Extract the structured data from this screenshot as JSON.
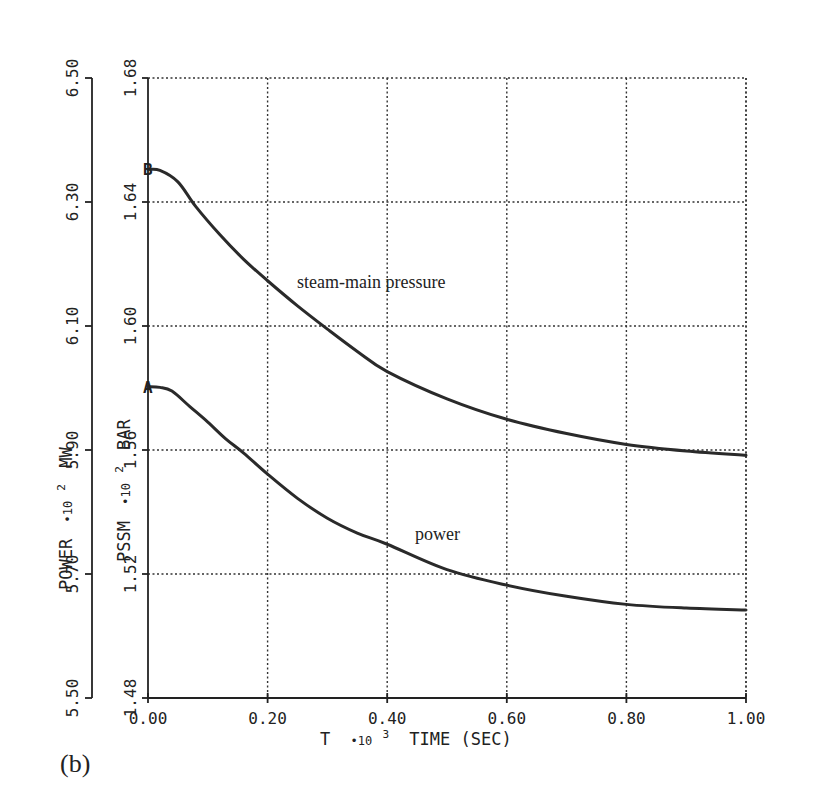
{
  "chart_data": {
    "type": "line",
    "panel_label": "(b)",
    "title": "",
    "xlabel": "T *10³ TIME (SEC)",
    "xlabel_parts": {
      "var": "T",
      "mult": "•10",
      "exp": "3",
      "rest": "TIME (SEC)"
    },
    "xlim": [
      0.0,
      1.0
    ],
    "xticks": [
      0.0,
      0.2,
      0.4,
      0.6,
      0.8,
      1.0
    ],
    "xtick_labels": [
      "0.00",
      "0.20",
      "0.40",
      "0.60",
      "0.80",
      "1.00"
    ],
    "grid": true,
    "y_axes": [
      {
        "id": "power",
        "label": "POWER *10² MW",
        "label_parts": {
          "var": "POWER",
          "mult": "•10",
          "exp": "2",
          "unit": "MW"
        },
        "ylim": [
          5.5,
          6.5
        ],
        "yticks": [
          5.5,
          5.7,
          5.9,
          6.1,
          6.3,
          6.5
        ],
        "ytick_labels": [
          "5.50",
          "5.70",
          "5.90",
          "6.10",
          "6.30",
          "6.50"
        ],
        "position": "outer-left"
      },
      {
        "id": "pssm",
        "label": "PSSM *10² BAR",
        "label_parts": {
          "var": "PSSM",
          "mult": "•10",
          "exp": "2",
          "unit": "BAR"
        },
        "ylim": [
          1.48,
          1.68
        ],
        "yticks": [
          1.48,
          1.52,
          1.56,
          1.6,
          1.64,
          1.68
        ],
        "ytick_labels": [
          "1.48",
          "1.52",
          "1.56",
          "1.60",
          "1.64",
          "1.68"
        ],
        "position": "inner-left"
      }
    ],
    "series": [
      {
        "name": "steam-main pressure",
        "marker": "B",
        "axis": "pssm",
        "annotation": "steam-main pressure",
        "x": [
          0.0,
          0.02,
          0.05,
          0.08,
          0.12,
          0.16,
          0.2,
          0.25,
          0.3,
          0.35,
          0.4,
          0.5,
          0.6,
          0.7,
          0.8,
          0.9,
          1.0
        ],
        "values": [
          1.6505,
          1.6502,
          1.6465,
          1.6385,
          1.6295,
          1.6215,
          1.6146,
          1.6065,
          1.599,
          1.5918,
          1.5853,
          1.5765,
          1.5699,
          1.5653,
          1.5618,
          1.5597,
          1.5583
        ]
      },
      {
        "name": "power",
        "marker": "A",
        "axis": "power",
        "annotation": "power",
        "x": [
          0.0,
          0.02,
          0.04,
          0.07,
          0.1,
          0.13,
          0.16,
          0.2,
          0.25,
          0.3,
          0.35,
          0.4,
          0.5,
          0.6,
          0.7,
          0.8,
          0.9,
          1.0
        ],
        "values": [
          6.002,
          6.001,
          5.995,
          5.97,
          5.945,
          5.918,
          5.895,
          5.861,
          5.822,
          5.79,
          5.766,
          5.748,
          5.707,
          5.682,
          5.664,
          5.651,
          5.645,
          5.642
        ]
      }
    ],
    "colors": {
      "ink": "#222222",
      "background": "#ffffff"
    }
  }
}
